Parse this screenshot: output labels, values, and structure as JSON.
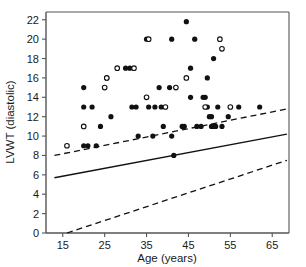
{
  "chart_data": {
    "type": "scatter",
    "title": "",
    "xlabel": "Age (years)",
    "ylabel": "LVWT (diastolic)",
    "xlim": [
      11,
      69
    ],
    "ylim": [
      0,
      22.8
    ],
    "xticks": [
      15,
      25,
      35,
      45,
      55,
      65
    ],
    "yticks": [
      0,
      2,
      4,
      6,
      8,
      10,
      12,
      14,
      16,
      18,
      20,
      22
    ],
    "ytick_labels": [
      "0",
      "2",
      "4",
      "6",
      "8",
      "10",
      "12",
      "14",
      "16",
      "18",
      "20",
      "22"
    ],
    "xtick_labels": [
      "15",
      "25",
      "35",
      "45",
      "55",
      "65"
    ],
    "grid": false,
    "legend": "none",
    "series": [
      {
        "name": "filled-circles",
        "marker": "filled circle",
        "points": [
          [
            20.0,
            15.0
          ],
          [
            20.0,
            13.0
          ],
          [
            22.0,
            13.0
          ],
          [
            20.0,
            9.0
          ],
          [
            21.0,
            9.0
          ],
          [
            23.0,
            9.0
          ],
          [
            24.0,
            11.0
          ],
          [
            25.5,
            16.0
          ],
          [
            26.5,
            12.0
          ],
          [
            30.0,
            17.0
          ],
          [
            31.0,
            17.0
          ],
          [
            31.5,
            13.0
          ],
          [
            32.5,
            13.0
          ],
          [
            33.0,
            10.0
          ],
          [
            35.0,
            20.0
          ],
          [
            35.5,
            13.0
          ],
          [
            36.5,
            10.0
          ],
          [
            37.0,
            13.0
          ],
          [
            38.0,
            15.0
          ],
          [
            38.5,
            13.0
          ],
          [
            39.0,
            11.0
          ],
          [
            40.5,
            15.0
          ],
          [
            41.0,
            20.0
          ],
          [
            41.0,
            10.0
          ],
          [
            41.5,
            8.0
          ],
          [
            43.5,
            11.0
          ],
          [
            44.0,
            11.0
          ],
          [
            44.5,
            21.8
          ],
          [
            45.5,
            17.0
          ],
          [
            45.5,
            14.0
          ],
          [
            46.5,
            20.0
          ],
          [
            47.0,
            11.0
          ],
          [
            48.0,
            11.0
          ],
          [
            48.5,
            14.0
          ],
          [
            49.0,
            14.0
          ],
          [
            49.5,
            16.0
          ],
          [
            49.5,
            13.0
          ],
          [
            50.0,
            12.0
          ],
          [
            50.5,
            12.0
          ],
          [
            50.5,
            11.0
          ],
          [
            51.0,
            18.0
          ],
          [
            51.0,
            11.0
          ],
          [
            51.5,
            11.0
          ],
          [
            52.0,
            13.0
          ],
          [
            53.0,
            11.0
          ],
          [
            54.5,
            12.0
          ],
          [
            57.0,
            13.0
          ],
          [
            62.0,
            13.0
          ]
        ]
      },
      {
        "name": "open-circles",
        "marker": "open circle",
        "points": [
          [
            16.0,
            9.0
          ],
          [
            20.0,
            11.0
          ],
          [
            25.0,
            15.0
          ],
          [
            25.5,
            16.0
          ],
          [
            28.0,
            17.0
          ],
          [
            32.0,
            17.0
          ],
          [
            35.5,
            20.0
          ],
          [
            35.0,
            14.0
          ],
          [
            39.5,
            13.0
          ],
          [
            42.0,
            15.0
          ],
          [
            44.5,
            16.0
          ],
          [
            49.0,
            13.0
          ],
          [
            52.5,
            20.0
          ],
          [
            53.0,
            19.0
          ],
          [
            55.0,
            13.0
          ]
        ]
      }
    ],
    "reference_lines": [
      {
        "name": "upper-dashed-limit",
        "style": "dashed",
        "x": [
          13.0,
          68.5
        ],
        "y": [
          8.0,
          12.8
        ]
      },
      {
        "name": "regression-line",
        "style": "solid",
        "x": [
          13.0,
          68.5
        ],
        "y": [
          5.7,
          10.2
        ]
      },
      {
        "name": "lower-dashed-limit",
        "style": "dashed",
        "x": [
          16.0,
          68.5
        ],
        "y": [
          0.0,
          7.5
        ]
      }
    ]
  }
}
